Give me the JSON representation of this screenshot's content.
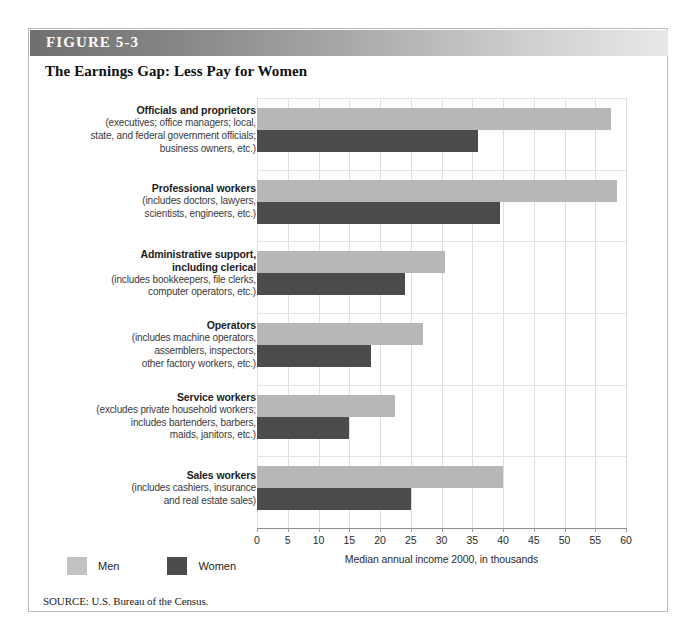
{
  "figure": {
    "label_prefix": "F",
    "label": "FIGURE 5-3",
    "title": "The Earnings Gap: Less Pay for Women",
    "source": "SOURCE: U.S. Bureau of the Census."
  },
  "legend": {
    "men_label": "Men",
    "women_label": "Women",
    "men_color": "#b7b7b7",
    "women_color": "#4b4b4b"
  },
  "chart_data": {
    "type": "bar",
    "orientation": "horizontal",
    "title": "The Earnings Gap: Less Pay for Women",
    "xlabel": "Median annual income 2000, in thousands",
    "ylabel": "",
    "xlim": [
      0,
      60
    ],
    "xticks": [
      0,
      5,
      10,
      15,
      20,
      25,
      30,
      35,
      40,
      45,
      50,
      55,
      60
    ],
    "xtick_labels": [
      "0",
      "5",
      "10",
      "15",
      "20",
      "25",
      "30",
      "35",
      "40",
      "45",
      "50",
      "55",
      "60"
    ],
    "grid": true,
    "legend_position": "bottom-left",
    "categories": [
      "Officials and proprietors",
      "Professional workers",
      "Administrative support, including clerical",
      "Operators",
      "Service workers",
      "Sales workers"
    ],
    "category_descriptions": [
      "(executives; office managers; local, state, and federal government officials; business owners, etc.)",
      "(includes doctors, lawyers, scientists, engineers, etc.)",
      "(includes bookkeepers, file clerks, computer operators, etc.)",
      "(includes machine operators, assemblers, inspectors, other factory workers, etc.)",
      "(excludes private household workers; includes bartenders, barbers, maids, janitors, etc.)",
      "(includes cashiers, insurance and real estate sales)"
    ],
    "series": [
      {
        "name": "Men",
        "color": "#b7b7b7",
        "values": [
          57.5,
          58.5,
          30.5,
          27.0,
          22.5,
          40.0
        ]
      },
      {
        "name": "Women",
        "color": "#4b4b4b",
        "values": [
          36.0,
          39.5,
          24.0,
          18.5,
          15.0,
          25.0
        ]
      }
    ]
  },
  "groups": [
    {
      "name": "Officials and proprietors",
      "sub_lines": [
        "(executives; office managers; local,",
        "state, and federal government officials;",
        "business owners, etc.)"
      ],
      "men": 57.5,
      "women": 36.0
    },
    {
      "name": "Professional workers",
      "sub_lines": [
        "(includes doctors, lawyers,",
        "scientists, engineers, etc.)"
      ],
      "men": 58.5,
      "women": 39.5
    },
    {
      "name_lines": [
        "Administrative support,",
        "including clerical"
      ],
      "name": "Administrative support, including clerical",
      "sub_lines": [
        "(includes bookkeepers, file clerks,",
        "computer operators, etc.)"
      ],
      "men": 30.5,
      "women": 24.0
    },
    {
      "name": "Operators",
      "sub_lines": [
        "(includes machine operators,",
        "assemblers, inspectors,",
        "other factory workers, etc.)"
      ],
      "men": 27.0,
      "women": 18.5
    },
    {
      "name": "Service workers",
      "sub_lines": [
        "(excludes private household workers;",
        "includes bartenders, barbers,",
        "maids, janitors, etc.)"
      ],
      "men": 22.5,
      "women": 15.0
    },
    {
      "name": "Sales workers",
      "sub_lines": [
        "(includes cashiers, insurance",
        "and real estate sales)"
      ],
      "men": 40.0,
      "women": 25.0
    }
  ]
}
